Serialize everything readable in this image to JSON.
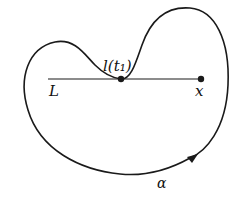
{
  "diagram": {
    "type": "closed curve with tangent line",
    "labels": {
      "point_label": "l(t₁)",
      "line_label": "L",
      "endpoint_label": "x",
      "curve_label": "α"
    },
    "colors": {
      "stroke": "#1a1a1a",
      "background": "#ffffff"
    }
  }
}
